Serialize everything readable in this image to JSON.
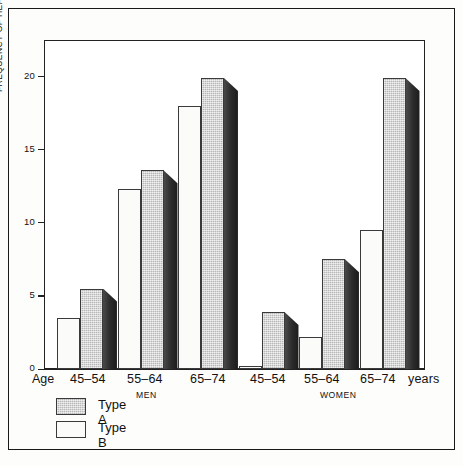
{
  "chart_data": {
    "type": "bar",
    "title": "",
    "xlabel": "",
    "ylabel": "FREQUENCY OF HEART ATTACK (%)",
    "ylim": [
      0,
      22.5
    ],
    "yticks": [
      0,
      5,
      10,
      15,
      20
    ],
    "ytick_labels": [
      "0",
      "5",
      "10",
      "15",
      "20"
    ],
    "grid": false,
    "legend_position": "below-left",
    "age_prefix_label": "Age",
    "unit_suffix_label": "years",
    "categories": [
      "45–54",
      "55–64",
      "65–74",
      "45–54",
      "55–64",
      "65–74"
    ],
    "section_labels": [
      "MEN",
      "WOMEN"
    ],
    "sections": [
      {
        "name": "MEN",
        "categories": [
          "45–54",
          "55–64",
          "65–74"
        ]
      },
      {
        "name": "WOMEN",
        "categories": [
          "45–54",
          "55–64",
          "65–74"
        ]
      }
    ],
    "series": [
      {
        "name": "Type A",
        "fill": "hatched-grey",
        "values": [
          5.5,
          13.6,
          19.9,
          3.9,
          7.5,
          19.9
        ]
      },
      {
        "name": "Type B",
        "fill": "white",
        "values": [
          3.5,
          12.3,
          18.0,
          0.2,
          2.2,
          9.5
        ]
      }
    ],
    "legend": [
      {
        "label": "Type A",
        "fill": "hatched-grey"
      },
      {
        "label": "Type B",
        "fill": "white"
      }
    ],
    "colors": {
      "type_a_face": "#b7b7b7",
      "type_a_side": "#2b2b2b",
      "type_b_face": "#fbfbfa",
      "axis": "#222222",
      "background": "#ffffff"
    }
  }
}
